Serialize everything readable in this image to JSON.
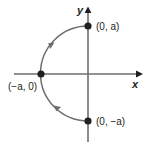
{
  "figure": {
    "background_color": "#ffffff",
    "stroke_color": "#6d6e71",
    "text_color": "#231f20",
    "axes": {
      "x_label": "x",
      "y_label": "y",
      "origin": [
        88,
        74
      ],
      "x_range_px": [
        14,
        140
      ],
      "y_range_px": [
        8,
        142
      ]
    },
    "points": [
      {
        "name": "top-point",
        "label": "(0, a)",
        "coords_px": [
          88,
          26
        ]
      },
      {
        "name": "left-point",
        "label": "(−a, 0)",
        "coords_px": [
          41,
          74
        ]
      },
      {
        "name": "bottom-point",
        "label": "(0, −a)",
        "coords_px": [
          88,
          121
        ]
      }
    ],
    "curve": {
      "type": "semicircle",
      "radius_px": 47,
      "direction": "from (0, -a) through (-a, 0) to (0, a)",
      "arrow_count": 2
    }
  }
}
